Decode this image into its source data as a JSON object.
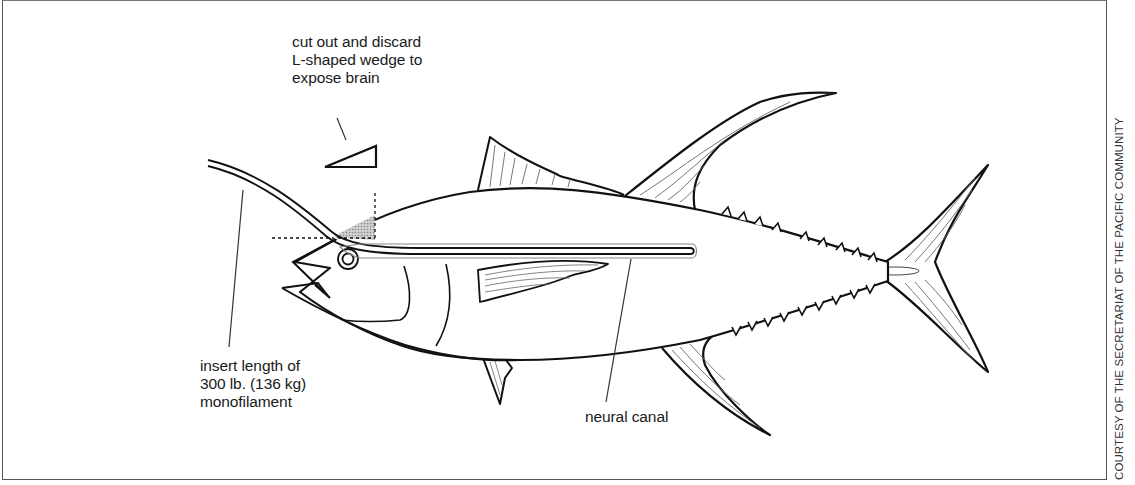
{
  "diagram": {
    "labels": {
      "wedge": [
        "cut out and discard",
        "L-shaped wedge to",
        "expose brain"
      ],
      "monofilament": [
        "insert length of",
        "300 lb. (136 kg)",
        "monofilament"
      ],
      "neural_canal": "neural canal"
    },
    "credit": "COURTESY OF THE SECRETARIAT OF THE PACIFIC COMMUNITY",
    "colors": {
      "line": "#111111",
      "wedge_fill": "#b8b8b8",
      "fin_stripe": "#666666",
      "background": "#ffffff",
      "frame": "#555555"
    }
  }
}
